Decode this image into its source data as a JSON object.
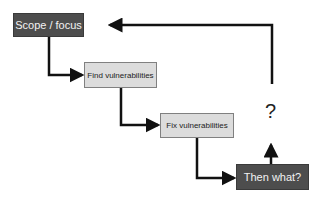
{
  "diagram": {
    "nodes": [
      {
        "id": "scope",
        "label": "Scope / focus"
      },
      {
        "id": "find",
        "label": "Find vulnerabilities"
      },
      {
        "id": "fix",
        "label": "Fix vulnerabilities"
      },
      {
        "id": "then",
        "label": "Then what?"
      }
    ],
    "question_mark": "?",
    "edges": [
      {
        "from": "scope",
        "to": "find"
      },
      {
        "from": "find",
        "to": "fix"
      },
      {
        "from": "fix",
        "to": "then"
      },
      {
        "from": "then",
        "to": "?"
      },
      {
        "from": "?",
        "to": "scope"
      }
    ],
    "colors": {
      "dark_box": "#4d4d4d",
      "light_box": "#dcdcdc",
      "line": "#111111"
    }
  }
}
